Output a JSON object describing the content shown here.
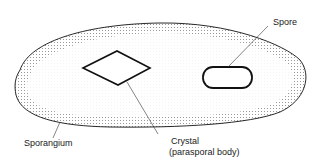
{
  "diagram": {
    "labels": {
      "spore": "Spore",
      "sporangium": "Sporangium",
      "crystal_line1": "Crystal",
      "crystal_line2": "(parasporal body)"
    },
    "colors": {
      "stroke": "#111111",
      "stipple": "#555555",
      "background": "#ffffff"
    }
  }
}
